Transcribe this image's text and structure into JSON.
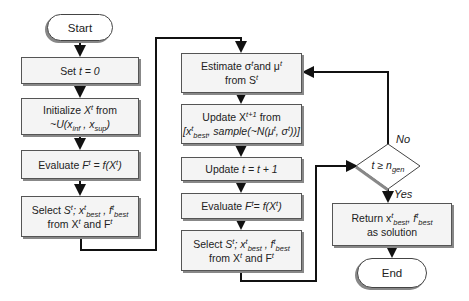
{
  "diagram": {
    "type": "flowchart",
    "left_column": {
      "start": "Start",
      "set": {
        "prefix": "Set ",
        "var": "t = 0"
      },
      "init": {
        "line1_prefix": "Initialize ",
        "line1_var": "X",
        "line1_sup": "t",
        "line1_suffix": " from",
        "line2": "~U(x",
        "sub1": "inf",
        "mid": " , x",
        "sub2": "sup",
        "end": ")"
      },
      "eval": {
        "prefix": "Evaluate ",
        "F": "F",
        "sup": "t",
        "eq": " = f(X",
        "sup2": "t",
        "end": ")"
      },
      "select": {
        "prefix": "Select ",
        "S": "S",
        "sup": "t",
        "x": "; x",
        "xsup": "t",
        "xsub": "best",
        "f": " , f",
        "fsup": "t",
        "fsub": "best",
        "line2a": "from X",
        "line2sup": "t",
        "line2b": " and F",
        "line2sup2": "t"
      }
    },
    "middle_column": {
      "estimate": {
        "a": "Estimate σ",
        "asup": "t",
        "b": "and μ",
        "bsup": "t",
        "line2": "from S",
        "line2sup": "t"
      },
      "update_x": {
        "a": "Update X",
        "asup": "t+1",
        "b": " from",
        "line2a": "[x",
        "l2sup": "t",
        "l2sub": "best",
        "line2b": ", sample(~N(μ",
        "l2sup2": "t",
        "line2c": ", σ",
        "l2sup3": "t",
        "line2d": "))]"
      },
      "update_t": {
        "prefix": "Update ",
        "var": "t = t + 1"
      },
      "eval": {
        "prefix": "Evaluate ",
        "F": "F",
        "sup": "t",
        "eq": "= f(X",
        "sup2": "t",
        "end": ")"
      },
      "select": {
        "prefix": "Select ",
        "S": "S",
        "sup": "t",
        "x": "; x",
        "xsup": "t",
        "xsub": "best",
        "f": " , f",
        "fsup": "t",
        "fsub": "best",
        "line2a": "from X",
        "line2sup": "t",
        "line2b": " and F",
        "line2sup2": "t"
      }
    },
    "right_column": {
      "decision": {
        "a": "t ≥ n",
        "sub": "gen"
      },
      "no_label": "No",
      "yes_label": "Yes",
      "return": {
        "a": "Return x",
        "asup": "t",
        "asub": "best",
        "b": ", f",
        "bsup": "t",
        "bsub": "best",
        "line2": "as solution"
      },
      "end": "End"
    }
  }
}
